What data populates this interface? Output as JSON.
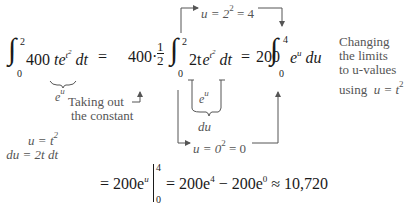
{
  "equation": {
    "lhs": {
      "integral_upper": "2",
      "integral_lower": "0",
      "integrand_coef": "400",
      "integrand_var": "t",
      "integrand_exp_base": "e",
      "integrand_exp": "t",
      "integrand_exp_pow": "2",
      "differential": "dt"
    },
    "eq1": "=",
    "step2": {
      "coef": "400",
      "dot": "·",
      "frac_num": "1",
      "frac_den": "2",
      "integral_upper": "2",
      "integral_lower": "0",
      "integrand": "2t",
      "exp_base": "e",
      "exp": "t",
      "exp_pow": "2",
      "differential": "dt"
    },
    "eq2": "=",
    "step3": {
      "coef": "200",
      "integral_upper": "4",
      "integral_lower": "0",
      "exp_base": "e",
      "exp": "u",
      "differential": "du"
    },
    "final": {
      "eq": "=",
      "antideriv": "200e",
      "antideriv_exp": "u",
      "eval_upper": "4",
      "eval_lower": "0",
      "eq2": "=",
      "term1": "200e",
      "term1_exp": "4",
      "minus": "−",
      "term2": "200e",
      "term2_exp": "0",
      "approx": "≈",
      "result": "10,720"
    }
  },
  "annotations": {
    "eu_under_lhs": {
      "base": "e",
      "exp": "u"
    },
    "taking_out": [
      "Taking out",
      "the constant"
    ],
    "substitution": {
      "line1": "u = t",
      "line1_pow": "2",
      "line2": "du = 2t dt"
    },
    "bracket_eu": {
      "base": "e",
      "exp": "u"
    },
    "bracket_du": "du",
    "upper_limit": {
      "text": "u = 2",
      "pow": "2",
      "rest": " = 4"
    },
    "lower_limit": {
      "text": "u = 0",
      "pow": "2",
      "rest": " = 0"
    },
    "changing_limits": [
      "Changing",
      "the limits",
      "to u-values",
      "using"
    ],
    "changing_limits_eq": {
      "text": "u = t",
      "pow": "2"
    }
  }
}
